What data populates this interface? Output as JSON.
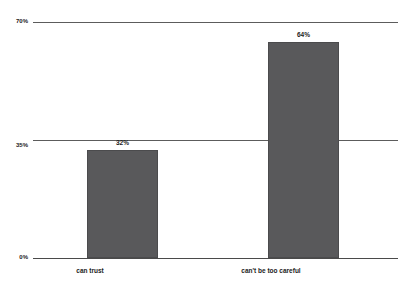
{
  "chart_data": {
    "type": "bar",
    "title": "",
    "subtitle": "",
    "xlabel": "",
    "ylabel": "",
    "categories": [
      "can trust",
      "can't be too careful"
    ],
    "values": [
      32,
      64
    ],
    "value_labels": [
      "32%",
      "64%"
    ],
    "ylim": [
      0,
      70
    ],
    "yticks": [
      0,
      35,
      70
    ],
    "ytick_labels": [
      "0%",
      "35%",
      "70%"
    ],
    "grid": true,
    "legend": false,
    "legend_position": "none",
    "bar_color": "#59595b",
    "gridline_color": "#5c5c5c",
    "text_color": "#1c1c1c",
    "background": "#ffffff",
    "series": [
      {
        "name": "",
        "values": [
          32,
          64
        ]
      }
    ]
  }
}
